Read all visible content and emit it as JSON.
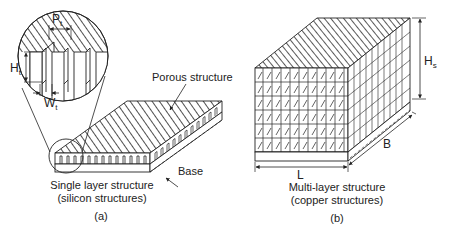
{
  "figure": {
    "panel_a": {
      "label": "(a)",
      "caption_line1": "Single layer structure",
      "caption_line2": "(silicon structures)",
      "callouts": {
        "porous": "Porous structure",
        "base": "Base"
      },
      "inset": {
        "pitch_symbol": "P",
        "pitch_sub": "t",
        "height_symbol": "H",
        "height_sub": "t",
        "width_symbol": "W",
        "width_sub": "t"
      }
    },
    "panel_b": {
      "label": "(b)",
      "caption_line1": "Multi-layer structure",
      "caption_line2": "(copper structures)",
      "dimensions": {
        "height_symbol": "H",
        "height_sub": "s",
        "length": "L",
        "breadth": "B"
      },
      "layers": 6
    },
    "colors": {
      "line": "#222222",
      "background": "#ffffff"
    }
  }
}
